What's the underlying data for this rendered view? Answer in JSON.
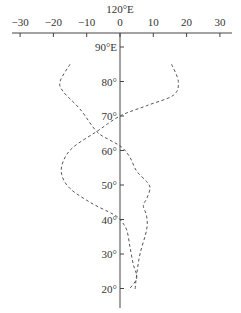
{
  "chart_data": {
    "type": "line",
    "title": "120°E",
    "xlabel": "",
    "ylabel": "",
    "xlim": [
      -30,
      30
    ],
    "ylim": [
      20,
      90
    ],
    "x_ticks": [
      "-30",
      "-20",
      "-10",
      "0",
      "10",
      "20",
      "30"
    ],
    "x_tick_values": [
      -30,
      -20,
      -10,
      0,
      10,
      20,
      30
    ],
    "y_ticks": [
      "90°E",
      "80°",
      "70°",
      "60°",
      "50°",
      "40°",
      "30°",
      "20°"
    ],
    "y_tick_values": [
      90,
      80,
      70,
      60,
      50,
      40,
      30,
      20
    ],
    "grid": false,
    "legend": null,
    "orientation": "vertical profile: value on x-axis, latitude on y-axis",
    "series": [
      {
        "name": "curve A",
        "style": "dashed",
        "points": [
          [
            -15,
            85
          ],
          [
            -18,
            80
          ],
          [
            -17,
            77
          ],
          [
            -12,
            72
          ],
          [
            -7,
            65.5
          ],
          [
            -3,
            63
          ],
          [
            0.5,
            61
          ],
          [
            3,
            58
          ],
          [
            5,
            54
          ],
          [
            8,
            51
          ],
          [
            9,
            49
          ],
          [
            8,
            46
          ],
          [
            7,
            44
          ],
          [
            8,
            41
          ],
          [
            8,
            37
          ],
          [
            6,
            30
          ],
          [
            5,
            24
          ],
          [
            4.5,
            19.5
          ]
        ]
      },
      {
        "name": "curve B",
        "style": "dashed",
        "points": [
          [
            15.5,
            85
          ],
          [
            17.5,
            80
          ],
          [
            16,
            76
          ],
          [
            8,
            73
          ],
          [
            0,
            70
          ],
          [
            -7,
            65.5
          ],
          [
            -14,
            61
          ],
          [
            -17,
            57
          ],
          [
            -17.5,
            53
          ],
          [
            -15,
            49
          ],
          [
            -9,
            45
          ],
          [
            -2,
            41.5
          ],
          [
            0,
            40
          ],
          [
            2,
            37
          ],
          [
            3,
            32
          ],
          [
            4,
            27
          ],
          [
            5,
            23
          ],
          [
            2.5,
            19.5
          ]
        ]
      }
    ]
  },
  "colors": {
    "axis": "#444444",
    "curve": "#555555",
    "text": "#333333"
  }
}
